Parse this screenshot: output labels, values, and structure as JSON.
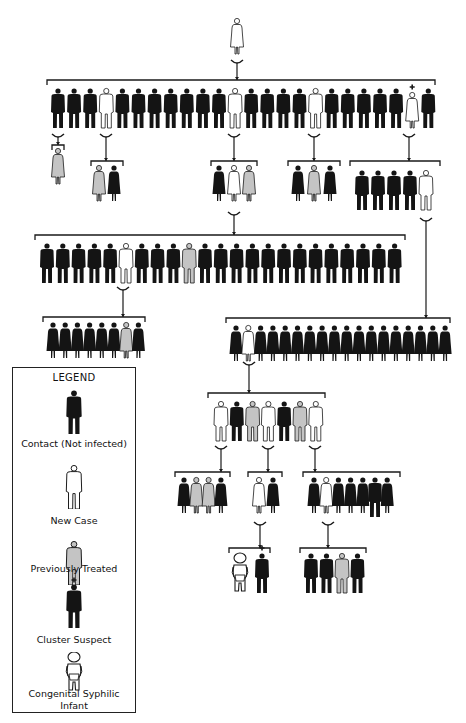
{
  "colors": {
    "contact": "#141414",
    "new_case": "#ffffff",
    "previously_treated": "#c4c4c4",
    "outline": "#1a1a1a",
    "background": "#ffffff"
  },
  "legend": {
    "title": "LEGEND",
    "items": [
      {
        "key": "contact",
        "label": "Contact (Not infected)",
        "icon": "male-figure-black"
      },
      {
        "key": "new_case",
        "label": "New Case",
        "icon": "male-figure-white"
      },
      {
        "key": "previously_treated",
        "label": "Previously Treated",
        "icon": "male-figure-gray"
      },
      {
        "key": "cluster_suspect",
        "label": "Cluster Suspect",
        "icon": "male-figure-black-plus"
      },
      {
        "key": "infant",
        "label": "Congenital Syphilic Infant",
        "label_line1": "Congenital Syphilic",
        "label_line2": "Infant",
        "icon": "infant-figure"
      }
    ]
  },
  "tree": {
    "index_case": {
      "sex": "F",
      "status": "new_case"
    },
    "generation_1": {
      "count": 24,
      "figures": [
        "M:contact",
        "M:contact",
        "M:contact",
        "M:new_case",
        "M:contact",
        "M:contact",
        "M:contact",
        "M:contact",
        "M:contact",
        "M:contact",
        "M:contact",
        "M:new_case",
        "M:contact",
        "M:contact",
        "M:contact",
        "M:contact",
        "M:new_case",
        "M:contact",
        "M:contact",
        "M:contact",
        "M:contact",
        "M:contact",
        "F:cluster_suspect_new",
        "M:contact"
      ]
    },
    "generation_2_groups": [
      {
        "from_index": 0,
        "figures": [
          "F:previously_treated"
        ]
      },
      {
        "from_index": 3,
        "figures": [
          "F:previously_treated",
          "F:contact"
        ]
      },
      {
        "from_index": 11,
        "figures": [
          "F:contact",
          "F:new_case",
          "F:previously_treated"
        ]
      },
      {
        "from_index": 16,
        "figures": [
          "F:contact",
          "F:previously_treated",
          "F:contact"
        ]
      },
      {
        "from_index": 22,
        "figures": [
          "M:contact",
          "M:contact",
          "M:contact",
          "M:contact",
          "M:new_case"
        ]
      }
    ],
    "generation_3_left": {
      "from": "generation_2_groups.2 new_case",
      "count": 23,
      "figures": [
        "M:contact",
        "M:contact",
        "M:contact",
        "M:contact",
        "M:contact",
        "M:new_case",
        "M:contact",
        "M:contact",
        "M:contact",
        "M:previously_treated",
        "M:contact",
        "M:contact",
        "M:contact",
        "M:contact",
        "M:contact",
        "M:contact",
        "M:contact",
        "M:contact",
        "M:contact",
        "M:contact",
        "M:contact",
        "M:contact",
        "M:contact"
      ]
    },
    "generation_4_left": {
      "from": "generation_3_left new_case",
      "count": 8,
      "figures": [
        "F:contact",
        "F:contact",
        "F:contact",
        "F:contact",
        "F:contact",
        "F:contact",
        "F:previously_treated",
        "F:contact"
      ]
    },
    "generation_3_right": {
      "from": "generation_2_groups.4 new_case",
      "count": 18,
      "figures": [
        "F:contact",
        "F:new_case",
        "F:contact",
        "F:contact",
        "F:contact",
        "F:contact",
        "F:contact",
        "F:contact",
        "F:contact",
        "F:contact",
        "F:contact",
        "F:contact",
        "F:contact",
        "F:contact",
        "F:contact",
        "F:contact",
        "F:contact",
        "F:contact"
      ]
    },
    "generation_4_right": {
      "from": "generation_3_right new_case",
      "count": 7,
      "figures": [
        "M:new_case",
        "M:contact",
        "M:previously_treated",
        "M:new_case",
        "M:contact",
        "M:previously_treated",
        "M:new_case"
      ]
    },
    "generation_5_groups": [
      {
        "from_index": 0,
        "figures": [
          "F:contact",
          "F:previously_treated",
          "F:previously_treated",
          "F:contact"
        ]
      },
      {
        "from_index": 3,
        "figures": [
          "F:new_case",
          "F:contact"
        ]
      },
      {
        "from_index": 6,
        "figures": [
          "F:contact",
          "F:new_case",
          "F:contact",
          "F:contact",
          "F:contact",
          "M:contact",
          "F:contact"
        ]
      }
    ],
    "generation_6_groups": [
      {
        "from": "generation_5_groups.1 new_case",
        "figures": [
          "I:congenital_infant",
          "M:cluster_suspect"
        ]
      },
      {
        "from": "generation_5_groups.2 new_case",
        "figures": [
          "M:contact",
          "M:contact",
          "M:previously_treated",
          "M:contact"
        ]
      }
    ]
  }
}
